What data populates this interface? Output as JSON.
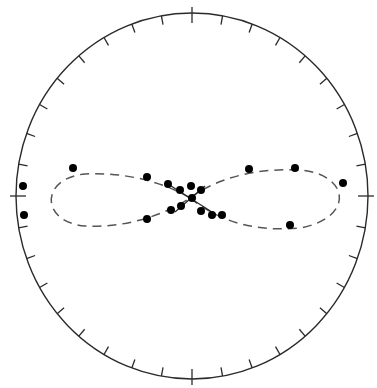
{
  "diagram": {
    "type": "stereonet-plot",
    "colors": {
      "background": "#ffffff",
      "stroke": "#2a2a2a",
      "points": "#000000",
      "dashed": "#555555"
    },
    "primitive_circle": {
      "cx": 192,
      "cy": 196,
      "rx": 176,
      "ry": 183
    },
    "tick_count": 36,
    "cardinal_ticks": [
      "N",
      "E",
      "S",
      "W"
    ],
    "great_circles": [
      {
        "name": "left-loop",
        "path": "M 190 198 C 160 180, 120 172, 85 174 C 40 178, 40 222, 85 226 C 120 228, 160 218, 190 198"
      },
      {
        "name": "right-loop",
        "path": "M 190 198 C 220 176, 260 168, 300 170 C 350 174, 355 218, 300 228 C 255 232, 220 222, 190 198"
      }
    ],
    "cross_lines": [
      {
        "x1": 168,
        "y1": 184,
        "x2": 215,
        "y2": 214
      },
      {
        "x1": 175,
        "y1": 212,
        "x2": 205,
        "y2": 186
      }
    ],
    "points": [
      {
        "x": 23,
        "y": 186
      },
      {
        "x": 24,
        "y": 215
      },
      {
        "x": 73,
        "y": 168
      },
      {
        "x": 147,
        "y": 177
      },
      {
        "x": 168,
        "y": 184
      },
      {
        "x": 180,
        "y": 190
      },
      {
        "x": 191,
        "y": 186
      },
      {
        "x": 201,
        "y": 190
      },
      {
        "x": 192,
        "y": 198
      },
      {
        "x": 181,
        "y": 206
      },
      {
        "x": 171,
        "y": 210
      },
      {
        "x": 147,
        "y": 219
      },
      {
        "x": 201,
        "y": 211
      },
      {
        "x": 212,
        "y": 215
      },
      {
        "x": 222,
        "y": 215
      },
      {
        "x": 249,
        "y": 169
      },
      {
        "x": 295,
        "y": 168
      },
      {
        "x": 343,
        "y": 183
      },
      {
        "x": 290,
        "y": 225
      }
    ]
  }
}
